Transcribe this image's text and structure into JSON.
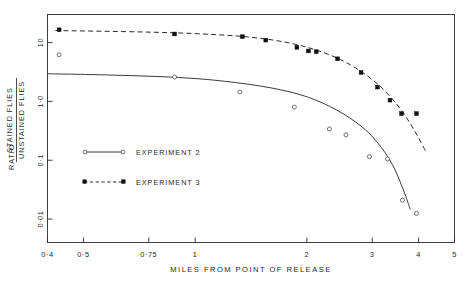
{
  "chart_data": {
    "type": "scatter",
    "title": "",
    "subtitle": "",
    "xlabel": "MILES FROM POINT OF RELEASE",
    "ylabel": "RATIO STAINED FLIES / UNSTAINED FLIES",
    "ylabel_prefix": "RATIO",
    "ylabel_numerator": "STAINED  FLIES",
    "ylabel_denominator": "UNSTAINED FLIES",
    "xscale": "log",
    "yscale": "log",
    "xlim": [
      0.4,
      5.0
    ],
    "ylim": [
      0.004,
      30.0
    ],
    "grid": false,
    "legend_position": "center-left",
    "xticks": [
      0.4,
      0.5,
      0.75,
      1,
      2,
      3,
      4,
      5
    ],
    "xtick_labels": [
      "0·4",
      "0·5",
      "0·75",
      "1",
      "2",
      "3",
      "4",
      "5"
    ],
    "yticks": [
      10,
      1,
      0.1,
      0.01
    ],
    "ytick_labels": [
      "10",
      "1·0",
      "0·1",
      "0·01"
    ],
    "series": [
      {
        "name": "EXPERIMENT 2",
        "marker": "open-circle",
        "line": "solid",
        "points": [
          {
            "x": 0.43,
            "y": 6.2
          },
          {
            "x": 0.88,
            "y": 2.6
          },
          {
            "x": 1.32,
            "y": 1.45
          },
          {
            "x": 1.85,
            "y": 0.8
          },
          {
            "x": 2.3,
            "y": 0.34
          },
          {
            "x": 2.55,
            "y": 0.27
          },
          {
            "x": 2.95,
            "y": 0.115
          },
          {
            "x": 3.3,
            "y": 0.105
          },
          {
            "x": 3.62,
            "y": 0.021
          },
          {
            "x": 3.95,
            "y": 0.0125
          }
        ],
        "fit_curve": [
          {
            "x": 0.4,
            "y": 2.95
          },
          {
            "x": 0.6,
            "y": 2.8
          },
          {
            "x": 0.9,
            "y": 2.55
          },
          {
            "x": 1.2,
            "y": 2.2
          },
          {
            "x": 1.6,
            "y": 1.7
          },
          {
            "x": 2.0,
            "y": 1.2
          },
          {
            "x": 2.4,
            "y": 0.72
          },
          {
            "x": 2.8,
            "y": 0.38
          },
          {
            "x": 3.1,
            "y": 0.2
          },
          {
            "x": 3.4,
            "y": 0.085
          },
          {
            "x": 3.65,
            "y": 0.03
          },
          {
            "x": 3.8,
            "y": 0.0145
          }
        ]
      },
      {
        "name": "EXPERIMENT 3",
        "marker": "filled-square",
        "line": "dashed",
        "points": [
          {
            "x": 0.43,
            "y": 16.5
          },
          {
            "x": 0.88,
            "y": 14.0
          },
          {
            "x": 1.34,
            "y": 12.6
          },
          {
            "x": 1.55,
            "y": 11.0
          },
          {
            "x": 1.88,
            "y": 8.3
          },
          {
            "x": 2.02,
            "y": 7.2
          },
          {
            "x": 2.12,
            "y": 7.0
          },
          {
            "x": 2.42,
            "y": 5.3
          },
          {
            "x": 2.8,
            "y": 3.1
          },
          {
            "x": 3.1,
            "y": 1.75
          },
          {
            "x": 3.35,
            "y": 1.05
          },
          {
            "x": 3.6,
            "y": 0.62
          },
          {
            "x": 3.95,
            "y": 0.62
          }
        ],
        "fit_curve": [
          {
            "x": 0.42,
            "y": 16.0
          },
          {
            "x": 0.7,
            "y": 15.2
          },
          {
            "x": 1.0,
            "y": 14.2
          },
          {
            "x": 1.4,
            "y": 12.4
          },
          {
            "x": 1.8,
            "y": 9.8
          },
          {
            "x": 2.2,
            "y": 6.9
          },
          {
            "x": 2.6,
            "y": 4.3
          },
          {
            "x": 3.0,
            "y": 2.35
          },
          {
            "x": 3.3,
            "y": 1.35
          },
          {
            "x": 3.6,
            "y": 0.7
          },
          {
            "x": 3.9,
            "y": 0.32
          },
          {
            "x": 4.2,
            "y": 0.135
          }
        ]
      }
    ]
  },
  "legend": {
    "items": [
      {
        "label": "EXPERIMENT 2",
        "style": "solid-open-circle"
      },
      {
        "label": "EXPERIMENT 3",
        "style": "dashed-filled-square"
      }
    ]
  },
  "colors": {
    "axis": "#2b2b2b",
    "series_2": "#3b3b3b",
    "series_3": "#111111",
    "background": "#ffffff"
  }
}
